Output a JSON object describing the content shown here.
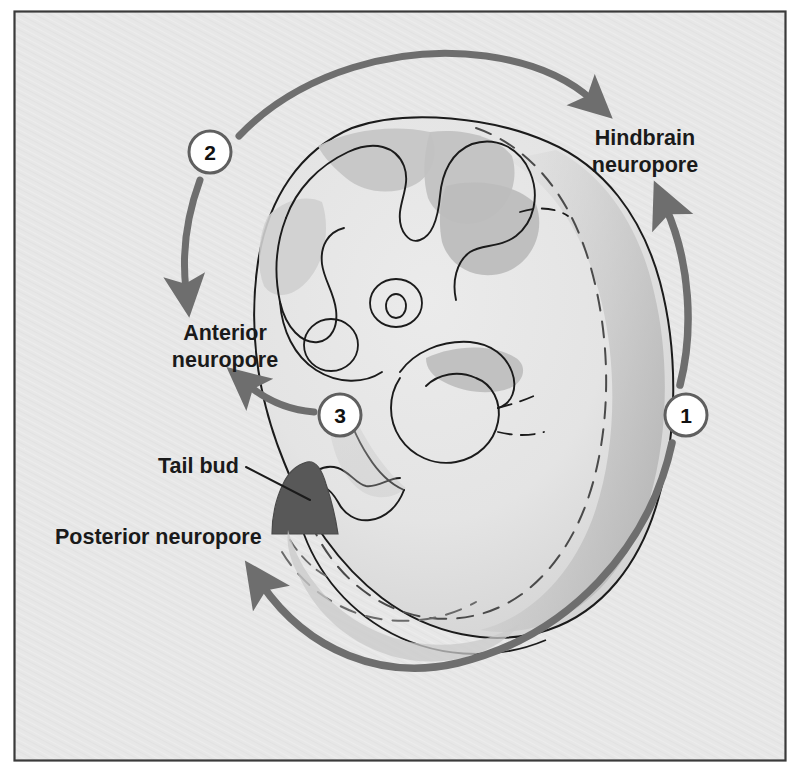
{
  "figure": {
    "width": 799,
    "height": 773,
    "background_color": "#e6e6e6",
    "frame_border_color": "#3a3a3a",
    "frame_inner_color": "#e9e9e9"
  },
  "colors": {
    "arrow_gray": "#6e6e6e",
    "outline_black": "#1b1b1b",
    "tail_bud_fill": "#585858",
    "shade_light": "#dcdcdc",
    "shade_mid": "#c9c9c9",
    "shade_dark": "#b4b4b4",
    "badge_fill": "#ffffff",
    "badge_ring": "#5f5f5f",
    "text_color": "#1a1a1a"
  },
  "labels": {
    "hindbrain": {
      "name": "hindbrain-neuropore-label",
      "line1": "Hindbrain",
      "line2": "neuropore",
      "x": 645,
      "y1": 145,
      "y2": 172,
      "align": "middle"
    },
    "anterior": {
      "name": "anterior-neuropore-label",
      "line1": "Anterior",
      "line2": "neuropore",
      "x": 225,
      "y1": 340,
      "y2": 367,
      "align": "middle"
    },
    "tail_bud": {
      "name": "tail-bud-label",
      "line1": "Tail bud",
      "x": 158,
      "y1": 473,
      "align": "start"
    },
    "posterior": {
      "name": "posterior-neuropore-label",
      "line1": "Posterior neuropore",
      "x": 55,
      "y1": 544,
      "align": "start"
    }
  },
  "badges": [
    {
      "id": "badge-1",
      "number": "1",
      "cx": 686,
      "cy": 415,
      "r": 21
    },
    {
      "id": "badge-2",
      "number": "2",
      "cx": 210,
      "cy": 152,
      "r": 21
    },
    {
      "id": "badge-3",
      "number": "3",
      "cx": 340,
      "cy": 415,
      "r": 21
    }
  ],
  "closure_steps": [
    {
      "step": 1,
      "badge": "1",
      "description": "Closure begins at the hindbrain level and proceeds both rostrally and caudally",
      "targets": [
        "Hindbrain neuropore",
        "Posterior neuropore"
      ]
    },
    {
      "step": 2,
      "badge": "2",
      "description": "Second closure site proceeds toward the hindbrain and the anterior neuropore",
      "targets": [
        "Hindbrain neuropore",
        "Anterior neuropore"
      ]
    },
    {
      "step": 3,
      "badge": "3",
      "description": "Third closure site proceeds rostrally toward the anterior neuropore",
      "targets": [
        "Anterior neuropore"
      ]
    }
  ],
  "anatomy": [
    {
      "name": "hindbrain-neuropore",
      "label": "Hindbrain neuropore"
    },
    {
      "name": "anterior-neuropore",
      "label": "Anterior neuropore"
    },
    {
      "name": "posterior-neuropore",
      "label": "Posterior neuropore"
    },
    {
      "name": "tail-bud",
      "label": "Tail bud"
    }
  ]
}
